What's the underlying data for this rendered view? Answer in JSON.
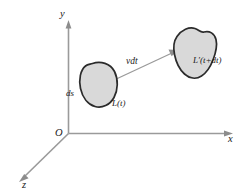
{
  "figure": {
    "background_color": "#ffffff",
    "axes": {
      "origin_label": "O",
      "x_label": "x",
      "y_label": "y",
      "z_label": "z",
      "axis_color": "#9a9a9a"
    },
    "labels": {
      "loop_initial": "L(t)",
      "loop_final": "L′(t+dt)",
      "displacement": "vdt",
      "line_element": "ds"
    },
    "shapes": {
      "fill_color": "#d9d9d9",
      "outline_color": "#2b2b2b",
      "small_blob_name": "loop-L-t",
      "large_blob_name": "loop-L-prime-t-plus-dt"
    },
    "vector": {
      "name": "displacement-vector",
      "color": "#9a9a9a",
      "from": [
        84,
        93
      ],
      "to": [
        176,
        52
      ]
    }
  }
}
